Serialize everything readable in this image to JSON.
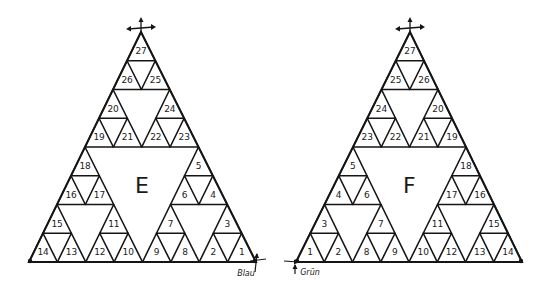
{
  "colors": {
    "ink": "#151515",
    "background": "#ffffff"
  },
  "triangles": [
    {
      "id": "E",
      "center_label": "E",
      "apex": [
        141,
        32
      ],
      "base_left": [
        29,
        262
      ],
      "base_right": [
        256,
        262
      ],
      "rows": [
        [
          "27"
        ],
        [
          "26",
          "25"
        ],
        [
          "20",
          "24"
        ],
        [
          "19",
          "21",
          "22",
          "23"
        ],
        [
          "18",
          "5"
        ],
        [
          "16",
          "17",
          "6",
          "4"
        ],
        [
          "15",
          "11",
          "7",
          "3"
        ],
        [
          "14",
          "13",
          "12",
          "10",
          "9",
          "8",
          "2",
          "1"
        ]
      ],
      "start_corner": "bottom-right",
      "start_note": "Blau",
      "top_marker": "arrows-icon"
    },
    {
      "id": "F",
      "center_label": "F",
      "apex": [
        410,
        32
      ],
      "base_left": [
        296,
        262
      ],
      "base_right": [
        522,
        262
      ],
      "rows": [
        [
          "27"
        ],
        [
          "25",
          "26"
        ],
        [
          "24",
          "20"
        ],
        [
          "23",
          "22",
          "21",
          "19"
        ],
        [
          "5",
          "18"
        ],
        [
          "4",
          "6",
          "17",
          "16"
        ],
        [
          "3",
          "7",
          "11",
          "15"
        ],
        [
          "1",
          "2",
          "8",
          "9",
          "10",
          "12",
          "13",
          "14"
        ]
      ],
      "start_corner": "bottom-left",
      "start_note": "Grün",
      "top_marker": "arrows-icon"
    }
  ]
}
